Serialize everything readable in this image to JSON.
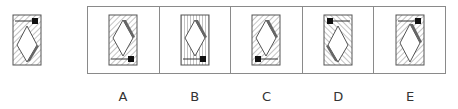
{
  "reference": {
    "hatch": "diagonal",
    "marker_position": "top-right",
    "arrow_direction": "left",
    "sliver_edge": "bottom-right"
  },
  "options": [
    {
      "label": "A",
      "hatch": "diagonal",
      "marker_position": "bottom-right",
      "arrow_direction": "left",
      "sliver_edge": "top-right"
    },
    {
      "label": "B",
      "hatch": "vertical",
      "marker_position": "bottom-right",
      "arrow_direction": "left",
      "sliver_edge": "top-right"
    },
    {
      "label": "C",
      "hatch": "diagonal",
      "marker_position": "bottom-left",
      "arrow_direction": "right",
      "sliver_edge": "top-right"
    },
    {
      "label": "D",
      "hatch": "diagonal-reverse",
      "marker_position": "top-left",
      "arrow_direction": "right",
      "sliver_edge": "bottom-left"
    },
    {
      "label": "E",
      "hatch": "diagonal",
      "marker_position": "top-right",
      "arrow_direction": "left",
      "sliver_edge": "top-right"
    }
  ],
  "colors": {
    "stroke": "#555555",
    "hatch": "#888888",
    "sliver": "#666666",
    "marker": "#111111",
    "border": "#8a8a8a",
    "label": "#333333"
  }
}
